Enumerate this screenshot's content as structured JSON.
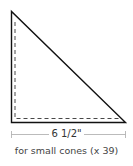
{
  "diagram": {
    "shape": "right-triangle",
    "stroke_color": "#111111",
    "dashed_color": "#333333",
    "dimension_color": "#aaaaaa",
    "dimension_label": "6 1/2\"",
    "caption": "for small cones (x 39)"
  }
}
